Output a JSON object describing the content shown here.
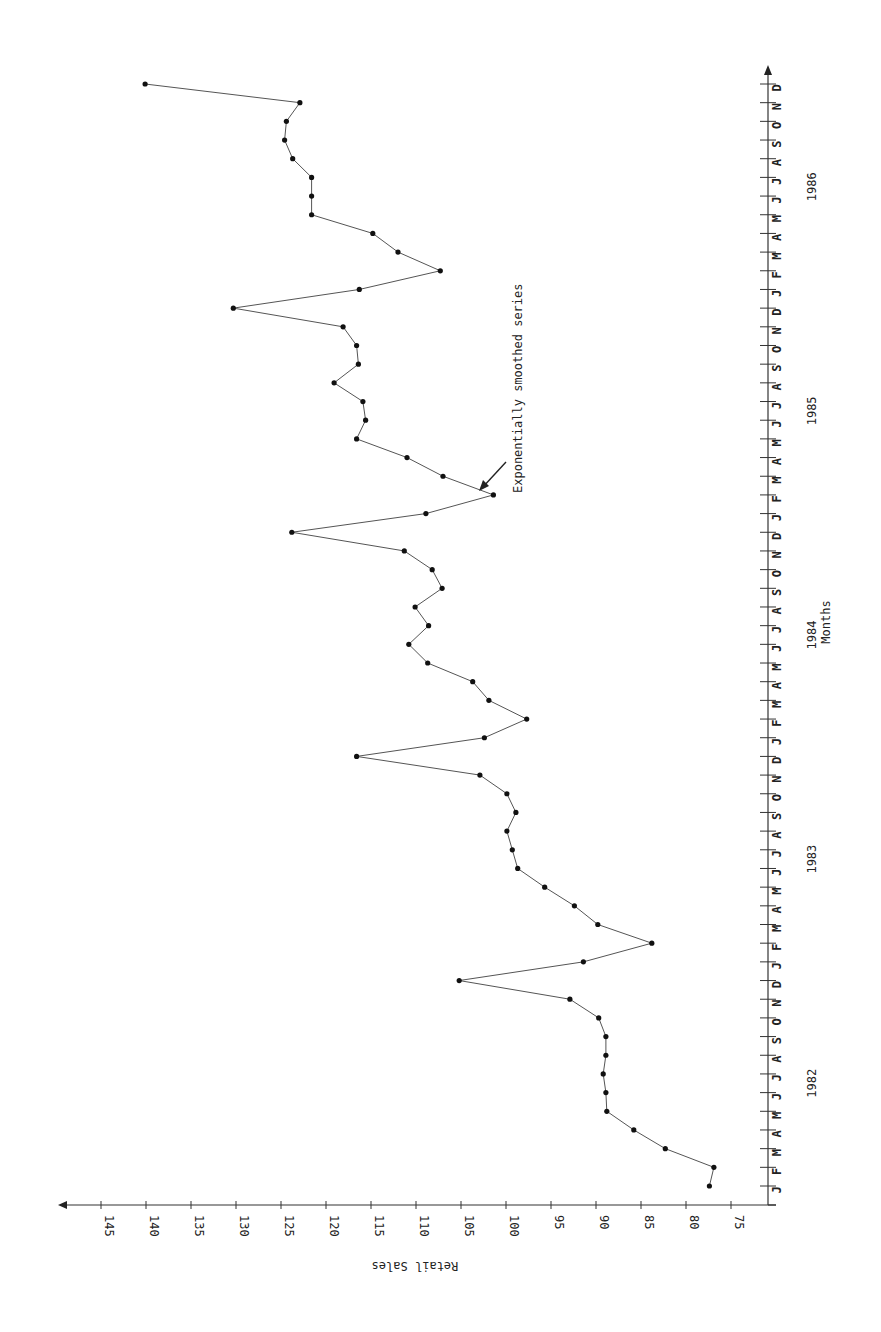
{
  "chart_data": {
    "type": "line",
    "title": "",
    "xlabel": "Months",
    "ylabel": "Retail Sales",
    "orientation": "rotated 90° clockwise (months run bottom-to-top along right edge; Retail Sales axis runs right-to-left along bottom)",
    "ylim": [
      75,
      145
    ],
    "y_ticks": [
      75,
      80,
      85,
      90,
      95,
      100,
      105,
      110,
      115,
      120,
      125,
      130,
      135,
      140,
      145
    ],
    "x_tick_labels": [
      "J",
      "F",
      "M",
      "A",
      "M",
      "J",
      "J",
      "A",
      "S",
      "O",
      "N",
      "D",
      "J",
      "F",
      "M",
      "A",
      "M",
      "J",
      "J",
      "A",
      "S",
      "O",
      "N",
      "D",
      "J",
      "F",
      "M",
      "A",
      "M",
      "J",
      "J",
      "A",
      "S",
      "O",
      "N",
      "D",
      "J",
      "F",
      "M",
      "A",
      "M",
      "J",
      "J",
      "A",
      "S",
      "O",
      "N",
      "D",
      "J",
      "F",
      "M",
      "A",
      "M",
      "J",
      "J",
      "A",
      "S",
      "O",
      "N",
      "D"
    ],
    "years": [
      "1982",
      "1983",
      "1984",
      "1985",
      "1986"
    ],
    "grid": false,
    "legend": null,
    "annotations": [
      {
        "text": "Exponentially smoothed series",
        "points_to": "Feb 1985"
      }
    ],
    "series": [
      {
        "name": "Exponentially smoothed series",
        "x": [
          "Jan 1982",
          "Feb 1982",
          "Mar 1982",
          "Apr 1982",
          "May 1982",
          "Jun 1982",
          "Jul 1982",
          "Aug 1982",
          "Sep 1982",
          "Oct 1982",
          "Nov 1982",
          "Dec 1982",
          "Jan 1983",
          "Feb 1983",
          "Mar 1983",
          "Apr 1983",
          "May 1983",
          "Jun 1983",
          "Jul 1983",
          "Aug 1983",
          "Sep 1983",
          "Oct 1983",
          "Nov 1983",
          "Dec 1983",
          "Jan 1984",
          "Feb 1984",
          "Mar 1984",
          "Apr 1984",
          "May 1984",
          "Jun 1984",
          "Jul 1984",
          "Aug 1984",
          "Sep 1984",
          "Oct 1984",
          "Nov 1984",
          "Dec 1984",
          "Jan 1985",
          "Feb 1985",
          "Mar 1985",
          "Apr 1985",
          "May 1985",
          "Jun 1985",
          "Jul 1985",
          "Aug 1985",
          "Sep 1985",
          "Oct 1985",
          "Nov 1985",
          "Dec 1985",
          "Jan 1986",
          "Feb 1986",
          "Mar 1986",
          "Apr 1986",
          "May 1986",
          "Jun 1986",
          "Jul 1986",
          "Aug 1986",
          "Sep 1986",
          "Oct 1986",
          "Nov 1986",
          "Dec 1986"
        ],
        "values": [
          77.4,
          76.9,
          82.3,
          85.8,
          88.8,
          88.9,
          89.2,
          88.9,
          88.9,
          89.7,
          92.9,
          105.2,
          91.4,
          83.8,
          89.8,
          92.4,
          95.7,
          98.7,
          99.3,
          99.9,
          98.9,
          99.9,
          102.9,
          116.6,
          102.4,
          97.7,
          101.9,
          103.7,
          108.7,
          110.8,
          108.6,
          110.1,
          107.1,
          108.2,
          111.3,
          123.8,
          108.9,
          101.4,
          107.0,
          111.0,
          116.6,
          115.6,
          115.9,
          119.1,
          116.4,
          116.6,
          118.1,
          130.3,
          116.3,
          107.3,
          112.0,
          114.8,
          121.6,
          121.6,
          121.6,
          123.7,
          124.6,
          124.4,
          122.9,
          140.1
        ]
      }
    ]
  },
  "layout": {
    "value_axis": {
      "x_at_75": 731,
      "px_per_unit": 9.0,
      "y": 1205,
      "x_start": 776,
      "x_end": 58
    },
    "month_axis": {
      "x": 768,
      "y_first": 1186,
      "y_last": 84,
      "y_end": 65,
      "y_start": 1205
    },
    "colors": {
      "line": "#555555",
      "points": "#111111",
      "axis": "#333333"
    }
  }
}
